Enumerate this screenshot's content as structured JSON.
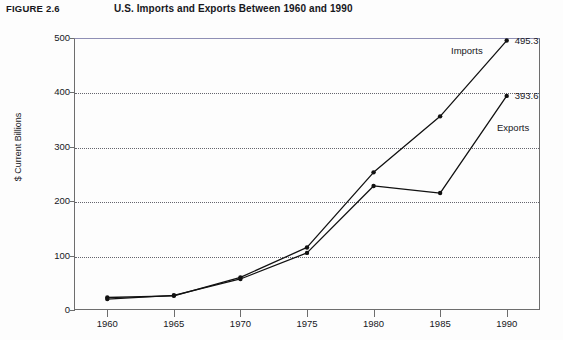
{
  "figure": {
    "number": "FIGURE 2.6",
    "title": "U.S. Imports and Exports Between 1960 and 1990"
  },
  "chart_data": {
    "type": "line",
    "title": "U.S. Imports and Exports Between 1960 and 1990",
    "xlabel": "",
    "ylabel": "$ Current Billions",
    "categories": [
      "1960",
      "1965",
      "1970",
      "1975",
      "1980",
      "1985",
      "1990"
    ],
    "x": [
      1960,
      1965,
      1970,
      1975,
      1980,
      1985,
      1990
    ],
    "xlim": [
      1957.5,
      1992.5
    ],
    "ylim": [
      0,
      500
    ],
    "yticks": [
      0,
      100,
      200,
      300,
      400,
      500
    ],
    "xticks": [
      1960,
      1965,
      1970,
      1975,
      1980,
      1985,
      1990
    ],
    "grid": "horizontal-dotted",
    "legend": "inline-labels",
    "series": [
      {
        "name": "Imports",
        "label": "Imports",
        "values": [
          23,
          26,
          60,
          115,
          253,
          356,
          495.3
        ],
        "end_label": "495.3",
        "color": "#111111"
      },
      {
        "name": "Exports",
        "label": "Exports",
        "values": [
          20,
          27,
          57,
          105,
          228,
          215,
          393.6
        ],
        "end_label": "393.6",
        "color": "#111111"
      }
    ],
    "annotations": [
      {
        "text": "Imports",
        "series": "Imports"
      },
      {
        "text": "495.3",
        "series": "Imports"
      },
      {
        "text": "393.6",
        "series": "Exports"
      },
      {
        "text": "Exports",
        "series": "Exports"
      }
    ]
  },
  "axes": {
    "y_tick_labels": [
      "500",
      "400",
      "300",
      "200",
      "100",
      "0"
    ],
    "x_tick_labels": [
      "1960",
      "1965",
      "1970",
      "1975",
      "1980",
      "1985",
      "1990"
    ],
    "y_axis_title": "$ Current Billions"
  },
  "colors": {
    "axis": "#6d6d6d",
    "grid": "#4a4a55",
    "line": "#111111",
    "text": "#17171c",
    "background": "#fdfdfd"
  }
}
